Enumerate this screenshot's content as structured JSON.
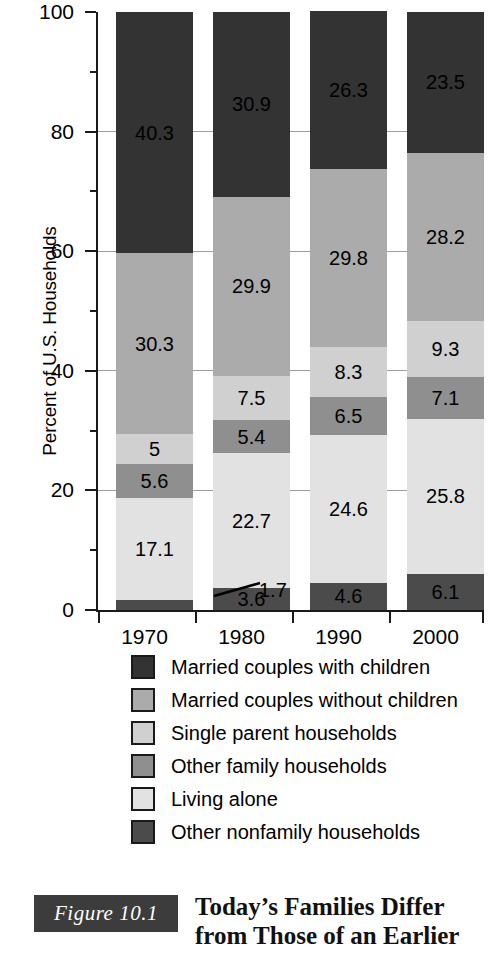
{
  "chart_data": {
    "type": "bar",
    "subtype": "stacked-bar-100",
    "title": "",
    "xlabel": "",
    "ylabel": "Percent of U.S. Households",
    "ylim": [
      0,
      100
    ],
    "ytick_labels": [
      "0",
      "20",
      "40",
      "60",
      "80",
      "100"
    ],
    "ytick_values": [
      0,
      20,
      40,
      60,
      80,
      100
    ],
    "yminor_values": [
      10,
      30,
      50,
      70,
      90
    ],
    "grid": true,
    "legend_position": "below",
    "categories": [
      "1970",
      "1980",
      "1990",
      "2000"
    ],
    "series": [
      {
        "name": "Other nonfamily households",
        "color": "#4b4b4b",
        "label_color": "dark",
        "values": [
          1.7,
          3.6,
          4.6,
          6.1
        ]
      },
      {
        "name": "Living alone",
        "color": "#e2e2e2",
        "label_color": "dark",
        "values": [
          17.1,
          22.7,
          24.6,
          25.8
        ]
      },
      {
        "name": "Other family households",
        "color": "#8f8f8f",
        "label_color": "dark",
        "values": [
          5.6,
          5.4,
          6.5,
          7.1
        ]
      },
      {
        "name": "Single parent households",
        "color": "#d0d0d0",
        "label_color": "dark",
        "values": [
          5.0,
          7.5,
          8.3,
          9.3
        ]
      },
      {
        "name": "Married couples without children",
        "color": "#ababab",
        "label_color": "dark",
        "values": [
          30.3,
          29.9,
          29.8,
          28.2
        ]
      },
      {
        "name": "Married couples with children",
        "color": "#333333",
        "label_color": "dark",
        "values": [
          40.3,
          30.9,
          26.3,
          23.5
        ]
      }
    ],
    "annotations": [
      {
        "text": "1.7",
        "note": "leader line from 1970 bottom segment"
      }
    ]
  },
  "legend": {
    "items": [
      {
        "label": "Married couples with children",
        "color": "#333333"
      },
      {
        "label": "Married couples without children",
        "color": "#ababab"
      },
      {
        "label": "Single parent households",
        "color": "#d0d0d0"
      },
      {
        "label": "Other family households",
        "color": "#8f8f8f"
      },
      {
        "label": "Living alone",
        "color": "#e2e2e2"
      },
      {
        "label": "Other nonfamily households",
        "color": "#4b4b4b"
      }
    ]
  },
  "caption": {
    "figure_number": "Figure 10.1",
    "line1": "Today’s Families Differ",
    "line2": "from Those of an Earlier"
  }
}
